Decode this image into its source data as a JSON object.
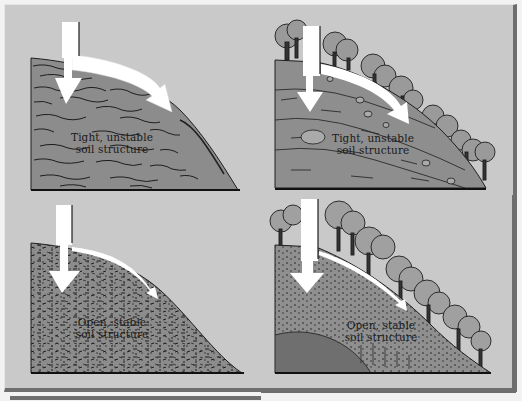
{
  "figure": {
    "colors": {
      "background": "#c9c9c9",
      "soil": "#8c8c8c",
      "soil_dark": "#6f6f6f",
      "ink": "#1e1e1e",
      "arrow": "#ffffff",
      "tree_fill": "#9a9a9a",
      "frame_shadow": "#6e6e6e"
    },
    "panels": [
      {
        "id": "top-left",
        "vegetation": "bare",
        "texture": "tight-streaks",
        "label_line1": "Tight, unstable",
        "label_line2": "soil structure",
        "arrows": [
          "infiltration-down",
          "runoff-along-slope"
        ],
        "runoff_arrow": "large"
      },
      {
        "id": "top-right",
        "vegetation": "trees",
        "texture": "layered-with-rocks",
        "label_line1": "Tight, unstable",
        "label_line2": "soil structure",
        "arrows": [
          "infiltration-down",
          "runoff-along-slope"
        ],
        "runoff_arrow": "large"
      },
      {
        "id": "bottom-left",
        "vegetation": "bare",
        "texture": "open-speckled",
        "label_line1": "Open, stable",
        "label_line2": "soil structure",
        "arrows": [
          "infiltration-down",
          "runoff-along-slope"
        ],
        "runoff_arrow": "thin"
      },
      {
        "id": "bottom-right",
        "vegetation": "dense-trees",
        "texture": "open-speckled-with-bedrock",
        "label_line1": "Open, stable",
        "label_line2": "soil structure",
        "arrows": [
          "infiltration-down",
          "runoff-along-slope"
        ],
        "runoff_arrow": "thin"
      }
    ]
  }
}
